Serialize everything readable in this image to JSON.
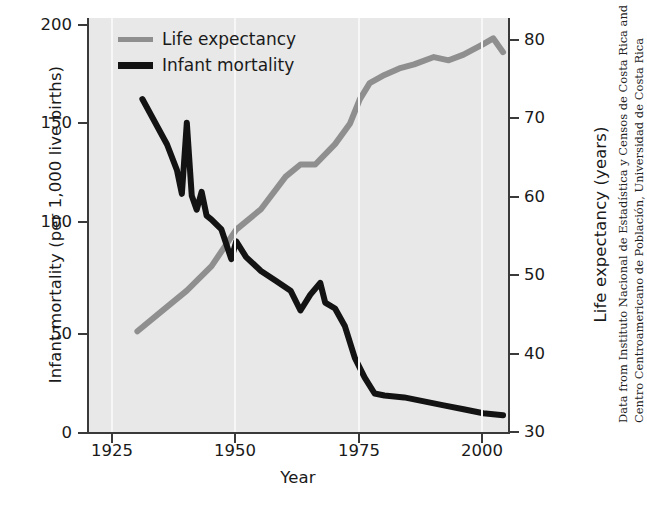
{
  "chart_data": {
    "type": "line",
    "title": "",
    "xlabel": "Year",
    "xlim": [
      1920,
      2005
    ],
    "xticks": [
      1925,
      1950,
      1975,
      2000
    ],
    "grid": "vertical light gridlines at x ticks",
    "legend_position": "top-left inside plot",
    "axes": [
      {
        "id": "left",
        "label": "Infant mortality (per 1,000 live births)",
        "ticks": [
          0,
          50,
          100,
          150,
          200
        ],
        "lim": [
          0,
          210
        ]
      },
      {
        "id": "right",
        "label": "Life expectancy (years)",
        "ticks": [
          30,
          40,
          50,
          60,
          70,
          80
        ],
        "lim": [
          30,
          81
        ]
      }
    ],
    "series": [
      {
        "name": "Life expectancy",
        "axis": "right",
        "color": "#8f8f8f",
        "unit": "years",
        "x": [
          1930,
          1935,
          1940,
          1945,
          1950,
          1955,
          1960,
          1963,
          1966,
          1970,
          1973,
          1975,
          1977,
          1980,
          1983,
          1986,
          1990,
          1993,
          1996,
          2000,
          2002,
          2004
        ],
        "y": [
          42.5,
          45.0,
          47.5,
          50.5,
          55.0,
          57.5,
          61.5,
          63.0,
          63.0,
          65.5,
          68.0,
          71.0,
          73.0,
          74.0,
          74.8,
          75.3,
          76.2,
          75.8,
          76.5,
          77.8,
          78.5,
          76.8
        ]
      },
      {
        "name": "Infant mortality",
        "axis": "left",
        "color": "#131313",
        "unit": "per 1,000 live births",
        "x": [
          1931,
          1936,
          1938,
          1939,
          1940,
          1941,
          1942,
          1943,
          1944,
          1945,
          1947,
          1949,
          1950,
          1952,
          1955,
          1958,
          1961,
          1963,
          1965,
          1967,
          1968,
          1970,
          1972,
          1974,
          1976,
          1978,
          1980,
          1984,
          1988,
          1992,
          1996,
          2000,
          2004
        ],
        "y": [
          169,
          146,
          133,
          121,
          157,
          120,
          113,
          122,
          110,
          108,
          103,
          88,
          97,
          89,
          82,
          77,
          72,
          62,
          70,
          76,
          66,
          63,
          54,
          38,
          28,
          20,
          19,
          18,
          16,
          14,
          12,
          10,
          9
        ]
      }
    ]
  },
  "legend": {
    "entries": [
      {
        "label": "Life expectancy",
        "swatch": "gray-line-swatch"
      },
      {
        "label": "Infant mortality",
        "swatch": "black-line-swatch"
      }
    ]
  },
  "axis_labels": {
    "left_title": "Infant mortality (per 1,000 live births)",
    "right_title": "Life expectancy (years)",
    "x_title": "Year"
  },
  "ticks": {
    "left": [
      "200",
      "150",
      "100",
      "50",
      "0"
    ],
    "right": [
      "80",
      "70",
      "60",
      "50",
      "40",
      "30"
    ],
    "x": [
      "1925",
      "1950",
      "1975",
      "2000"
    ]
  },
  "credit": {
    "line1": "Data from Instituto Nacional de Estadística y Censos de Costa Rica and",
    "line2": "Centro Centroamericano de Población, Universidad de Costa Rica"
  },
  "colors": {
    "life_expectancy": "#8f8f8f",
    "infant_mortality": "#131313",
    "panel_background": "#e8e8e8",
    "gridline": "#f7f7f7",
    "axis": "#3a3a3a",
    "text": "#1a1a1a"
  }
}
